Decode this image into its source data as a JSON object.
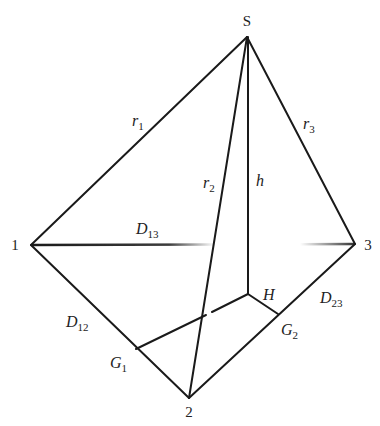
{
  "diagram": {
    "type": "tetrahedron-geometry",
    "colors": {
      "stroke": "#1a1a1a",
      "text": "#222222",
      "background": "#ffffff"
    },
    "vertices": {
      "S": {
        "label": "S",
        "x": 247,
        "y": 37
      },
      "v1": {
        "label": "1",
        "x": 31,
        "y": 245
      },
      "v2": {
        "label": "2",
        "x": 189,
        "y": 398
      },
      "v3": {
        "label": "3",
        "x": 355,
        "y": 244
      },
      "H": {
        "label": "H",
        "x": 248,
        "y": 294
      },
      "G1": {
        "label": "G",
        "sub": "1",
        "x": 136,
        "y": 349
      },
      "G2": {
        "label": "G",
        "sub": "2",
        "x": 278,
        "y": 314
      }
    },
    "edges": {
      "r1": {
        "label": "r",
        "sub": "1",
        "from": "S",
        "to": "1"
      },
      "r2": {
        "label": "r",
        "sub": "2",
        "from": "S",
        "to": "2"
      },
      "r3": {
        "label": "r",
        "sub": "3",
        "from": "S",
        "to": "3"
      },
      "h": {
        "label": "h",
        "from": "S",
        "to": "H"
      },
      "D12": {
        "label": "D",
        "sub": "12",
        "from": "1",
        "to": "2"
      },
      "D13": {
        "label": "D",
        "sub": "13",
        "from": "1",
        "to": "3"
      },
      "D23": {
        "label": "D",
        "sub": "23",
        "from": "2",
        "to": "3"
      },
      "HG1": {
        "from": "H",
        "to": "G1"
      },
      "HG2": {
        "from": "H",
        "to": "G2"
      }
    }
  }
}
